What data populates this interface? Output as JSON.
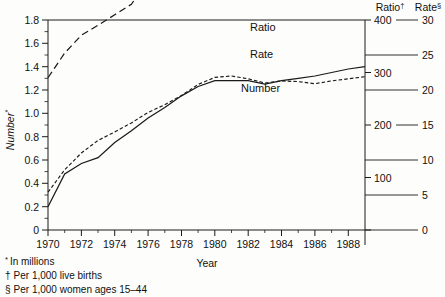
{
  "chart_data": {
    "type": "line",
    "title": "",
    "xlabel": "Year",
    "ylabel": "Number*",
    "x": [
      1970,
      1971,
      1972,
      1973,
      1974,
      1975,
      1976,
      1977,
      1978,
      1979,
      1980,
      1981,
      1982,
      1983,
      1984,
      1985,
      1986,
      1987,
      1988,
      1989
    ],
    "xlim": [
      1970,
      1989
    ],
    "xticks_major": [
      1970,
      1972,
      1974,
      1976,
      1978,
      1980,
      1982,
      1984,
      1986,
      1988
    ],
    "xticks_minor_every": 1,
    "grid": false,
    "legend_position": "inline-right",
    "axes": [
      {
        "id": "left",
        "name": "Number",
        "title": "Number*",
        "unit": "millions",
        "lim": [
          0,
          1.8
        ],
        "ticks": [
          "1.8",
          "1.6",
          "1.4",
          "1.2",
          "1.0",
          "0.8",
          "0.6",
          "0.4",
          "0.2",
          "0"
        ],
        "tick_values": [
          1.8,
          1.6,
          1.4,
          1.2,
          1.0,
          0.8,
          0.6,
          0.4,
          0.2,
          0
        ]
      },
      {
        "id": "ratio",
        "name": "Ratio",
        "header": "Ratio",
        "header_sup": "†",
        "unit": "per 1,000 live births",
        "lim": [
          0,
          400
        ],
        "ticks": [
          "400",
          "300",
          "200",
          "100"
        ],
        "tick_values": [
          400,
          300,
          200,
          100
        ]
      },
      {
        "id": "rate",
        "name": "Rate",
        "header": "Rate",
        "header_sup": "§",
        "unit": "per 1,000 women ages 15–44",
        "lim": [
          0,
          30
        ],
        "ticks": [
          "30",
          "25",
          "20",
          "15",
          "10",
          "5",
          "0"
        ],
        "tick_values": [
          30,
          25,
          20,
          15,
          10,
          5,
          0
        ]
      }
    ],
    "series": [
      {
        "name": "Ratio",
        "label": "Ratio",
        "axis": "ratio",
        "style": "long-dash",
        "values": [
          290,
          337,
          371,
          390,
          410,
          430,
          477,
          500,
          513,
          530,
          546,
          544,
          542,
          536,
          550,
          542,
          538,
          532,
          527,
          525
        ]
      },
      {
        "name": "Rate",
        "label": "Rate",
        "axis": "rate",
        "style": "short-dash",
        "values": [
          5.4,
          8.6,
          11.0,
          12.8,
          14.0,
          15.3,
          16.8,
          17.9,
          19.2,
          20.8,
          21.8,
          22.0,
          21.6,
          21.0,
          21.3,
          21.2,
          20.9,
          21.3,
          21.6,
          21.9
        ]
      },
      {
        "name": "Number",
        "label": "Number",
        "axis": "left",
        "style": "solid",
        "values": [
          0.2,
          0.48,
          0.57,
          0.62,
          0.75,
          0.85,
          0.96,
          1.05,
          1.15,
          1.23,
          1.28,
          1.28,
          1.28,
          1.25,
          1.28,
          1.3,
          1.32,
          1.35,
          1.38,
          1.4
        ]
      }
    ],
    "footnotes": [
      {
        "marker": "*",
        "text": "In millions"
      },
      {
        "marker": "†",
        "text": "Per 1,000 live births"
      },
      {
        "marker": "§",
        "text": "Per 1,000 women ages 15–44"
      }
    ]
  },
  "labels": {
    "xaxis_title": "Year",
    "yaxis_title": "Number",
    "yaxis_title_sup": "*",
    "ratio_header": "Ratio",
    "ratio_header_sup": "†",
    "rate_header": "Rate",
    "rate_header_sup": "§",
    "series_ratio": "Ratio",
    "series_rate": "Rate",
    "series_number": "Number"
  },
  "left_ticks": {
    "t0": "1.8",
    "t1": "1.6",
    "t2": "1.4",
    "t3": "1.2",
    "t4": "1.0",
    "t5": "0.8",
    "t6": "0.6",
    "t7": "0.4",
    "t8": "0.2",
    "t9": "0"
  },
  "x_ticks": {
    "t0": "1970",
    "t1": "1972",
    "t2": "1974",
    "t3": "1976",
    "t4": "1978",
    "t5": "1980",
    "t6": "1982",
    "t7": "1984",
    "t8": "1986",
    "t9": "1988"
  },
  "ratio_ticks": {
    "t0": "400",
    "t1": "300",
    "t2": "200",
    "t3": "100"
  },
  "rate_ticks": {
    "t0": "30",
    "t1": "25",
    "t2": "20",
    "t3": "15",
    "t4": "10",
    "t5": "5",
    "t6": "0"
  },
  "footnotes": {
    "f0_marker": "*",
    "f0_text": "In millions",
    "f1_marker": "†",
    "f1_text": "Per 1,000 live births",
    "f2_marker": "§",
    "f2_text": "Per 1,000 women ages 15–44"
  },
  "colors": {
    "ink": "#1a1a1a",
    "paper": "#fdfdfb"
  }
}
